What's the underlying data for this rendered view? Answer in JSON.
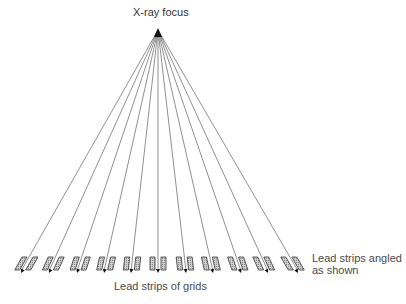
{
  "labels": {
    "focus": "X-ray focus",
    "grid_strips": "Lead strips of grids",
    "angled_line1": "Lead strips angled",
    "angled_line2": "as shown"
  },
  "colors": {
    "ray": "#444444",
    "strip_border": "#333333",
    "strip_fill": "#bfbfbf",
    "text": "#4a4a4a"
  },
  "geometry": {
    "focus": [
      158,
      30
    ],
    "ray_end_y": 273,
    "strip_top": 257,
    "strip_bottom": 270,
    "strip_width": 5,
    "strip_gap": 3,
    "ray_end_x": [
      21,
      49,
      77,
      104,
      131,
      158,
      186,
      213,
      241,
      268,
      298
    ]
  }
}
